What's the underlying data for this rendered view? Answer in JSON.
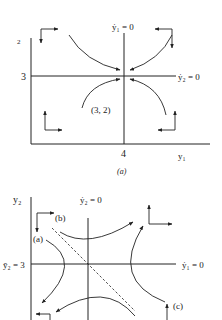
{
  "panel_a": {
    "caption": "(a)",
    "y_axis_label": "2",
    "x_axis_label": "y₁",
    "x_tick": "4",
    "y_tick": "3",
    "nullcline_vertical": "ẏ₁ = 0",
    "nullcline_horizontal": "ẏ₂ = 0",
    "point_label": "(3, 2)",
    "equilibrium_type": "stable node"
  },
  "panel_b": {
    "y_axis_label": "y₂",
    "y_tick": "ȳ₂ = 3",
    "nullcline_vertical": "ẏ₂ = 0",
    "nullcline_horizontal": "ẏ₁ = 0",
    "path_labels": [
      "(a)",
      "(b)",
      "(c)"
    ],
    "equilibrium_type": "saddle point",
    "saddle_path": "dashed"
  },
  "colors": {
    "ink": "#222222",
    "background": "#ffffff"
  }
}
